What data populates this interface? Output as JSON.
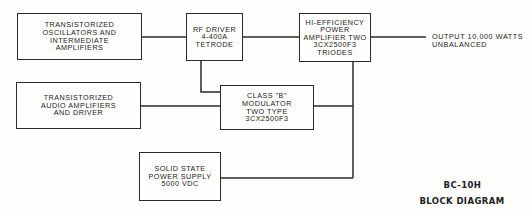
{
  "diagram": {
    "title_line1": "BC-10H",
    "title_line2": "BLOCK DIAGRAM",
    "blocks": [
      {
        "id": "oscillators",
        "label": "TRANSISTORIZED\nOSCILLATORS AND\nINTERMEDIATE\nAMPLIFIERS"
      },
      {
        "id": "rf_driver",
        "label": "RF DRIVER\n4-400A\nTETRODE"
      },
      {
        "id": "power_amp",
        "label": "HI-EFFICIENCY\nPOWER\nAMPLIFIER TWO\n3CX2500F3\nTRIODES"
      },
      {
        "id": "audio",
        "label": "TRANSISTORIZED\nAUDIO AMPLIFIERS\nAND DRIVER"
      },
      {
        "id": "modulator",
        "label": "CLASS \"B\"\nMODULATOR\nTWO TYPE\n3CX2500F3"
      },
      {
        "id": "power_supply",
        "label": "SOLID STATE\nPOWER SUPPLY\n5000 VDC"
      }
    ],
    "output_label": "OUTPUT 10,000 WATTS\nUNBALANCED",
    "connections": [
      [
        "oscillators",
        "rf_driver"
      ],
      [
        "rf_driver",
        "power_amp"
      ],
      [
        "power_amp",
        "output"
      ],
      [
        "rf_driver",
        "modulator"
      ],
      [
        "audio",
        "modulator"
      ],
      [
        "modulator",
        "power_amp"
      ],
      [
        "power_supply",
        "power_amp"
      ]
    ]
  }
}
